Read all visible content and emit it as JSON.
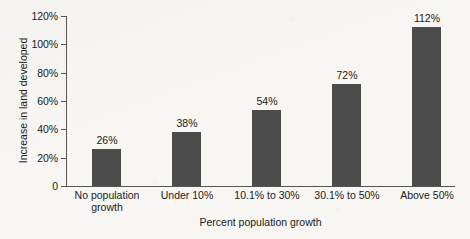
{
  "chart_data": {
    "type": "bar",
    "title": "",
    "xlabel": "Percent population growth",
    "ylabel": "Increase in land developed",
    "categories": [
      "No population growth",
      "Under 10%",
      "10.1% to 30%",
      "30.1% to 50%",
      "Above 50%"
    ],
    "category_lines": [
      [
        "No population",
        "growth"
      ],
      [
        "Under 10%",
        ""
      ],
      [
        "10.1% to 30%",
        ""
      ],
      [
        "30.1% to 50%",
        ""
      ],
      [
        "Above 50%",
        ""
      ]
    ],
    "values": [
      26,
      38,
      54,
      72,
      112
    ],
    "value_labels": [
      "26%",
      "38%",
      "54%",
      "72%",
      "112%"
    ],
    "ylim": [
      0,
      120
    ],
    "yticks": [
      0,
      20,
      40,
      60,
      80,
      100,
      120
    ],
    "ytick_labels": [
      "0",
      "20%",
      "40%",
      "60%",
      "80%",
      "100%",
      "120%"
    ],
    "grid": false,
    "legend": false,
    "bar_color": "#4b4b4b",
    "axis_color": "#555555",
    "background_color": "#f7f6f3"
  }
}
